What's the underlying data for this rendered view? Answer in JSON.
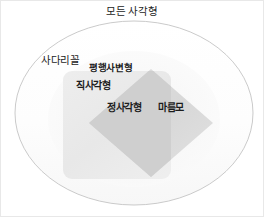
{
  "diagram": {
    "type": "euler-diagram",
    "title": "모든 사각형",
    "regions": {
      "universe": {
        "label": "모든 사각형",
        "shape": "ellipse",
        "outline_color": "#bdbdbd",
        "fill_color": "#fcfcfc"
      },
      "trapezoid": {
        "label": "사다리꼴",
        "shape": "ellipse-interior"
      },
      "parallelogram": {
        "label": "평행사변형",
        "shape": "rounded-square",
        "fill_color": "#ebebeb"
      },
      "rectangle": {
        "label": "직사각형",
        "shape": "rounded-square",
        "fill_color": "#ebebeb"
      },
      "rhombus": {
        "label": "마름모",
        "shape": "diamond",
        "fill_color": "#dcdcdc"
      },
      "square": {
        "label": "정사각형",
        "shape": "intersection",
        "fill_color": "#cfcfcf"
      }
    },
    "colors": {
      "text": "#1c1c1c",
      "outer_outline": "#bdbdbd",
      "square_region": "#ebebeb",
      "diamond_region": "#dcdcdc",
      "overlap_region": "#cfcfcf",
      "background": "#ffffff",
      "image_border": "#e8e8e8"
    }
  }
}
